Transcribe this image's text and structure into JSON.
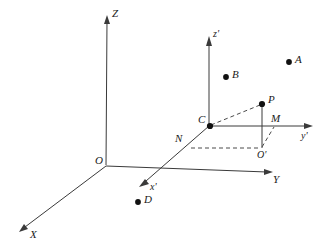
{
  "figure": {
    "background_color": "#ffffff",
    "line_color": "#3a3a3a",
    "point_color": "#111111",
    "width": 329,
    "height": 251
  },
  "axes": {
    "primary": [
      {
        "id": "z-axis",
        "label": "Z",
        "label_x": 112,
        "label_y": 8,
        "from": [
          106,
          165
        ],
        "to": [
          107,
          20
        ]
      },
      {
        "id": "y-axis",
        "label": "Y",
        "label_x": 273,
        "label_y": 174,
        "from": [
          106,
          166
        ],
        "to": [
          269,
          172
        ]
      },
      {
        "id": "x-axis",
        "label": "X",
        "label_x": 30,
        "label_y": 230,
        "from": [
          106,
          166
        ],
        "to": [
          23,
          228
        ]
      }
    ],
    "secondary": [
      {
        "id": "z-prime-axis",
        "label": "z'",
        "label_x": 213,
        "label_y": 29,
        "from": [
          209,
          126
        ],
        "to": [
          209,
          41
        ]
      },
      {
        "id": "y-prime-axis",
        "label": "y'",
        "label_x": 302,
        "label_y": 131,
        "from": [
          209,
          126
        ],
        "to": [
          309,
          126
        ]
      },
      {
        "id": "x-prime-axis",
        "label": "x'",
        "label_x": 150,
        "label_y": 183,
        "from": [
          209,
          126
        ],
        "to": [
          144,
          183
        ]
      }
    ]
  },
  "points": [
    {
      "id": "point-o",
      "label": "O",
      "dot": false,
      "x": 106,
      "y": 166,
      "label_x": 95,
      "label_y": 156
    },
    {
      "id": "point-c",
      "label": "C",
      "dot": true,
      "x": 210,
      "y": 126,
      "label_x": 198,
      "label_y": 114
    },
    {
      "id": "point-p",
      "label": "P",
      "dot": true,
      "x": 262,
      "y": 104,
      "label_x": 268,
      "label_y": 94
    },
    {
      "id": "point-a",
      "label": "A",
      "dot": true,
      "x": 289,
      "y": 62,
      "label_x": 295,
      "label_y": 54
    },
    {
      "id": "point-b",
      "label": "B",
      "dot": true,
      "x": 226,
      "y": 77,
      "label_x": 232,
      "label_y": 69
    },
    {
      "id": "point-d",
      "label": "D",
      "dot": true,
      "x": 138,
      "y": 202,
      "label_x": 144,
      "label_y": 194
    },
    {
      "id": "point-n",
      "label": "N",
      "dot": false,
      "x": 189,
      "y": 148,
      "label_x": 175,
      "label_y": 133
    },
    {
      "id": "point-m",
      "label": "M",
      "dot": false,
      "x": 272,
      "y": 126,
      "label_x": 271,
      "label_y": 114
    },
    {
      "id": "point-o-prime",
      "label": "O'",
      "dot": false,
      "x": 262,
      "y": 148,
      "label_x": 257,
      "label_y": 150
    }
  ],
  "segments": [
    {
      "id": "segment-c-p",
      "style": "dashed",
      "from": [
        211,
        126
      ],
      "to": [
        261,
        104
      ]
    },
    {
      "id": "segment-p-o-prime",
      "style": "solid",
      "from": [
        262,
        105
      ],
      "to": [
        262,
        148
      ]
    },
    {
      "id": "segment-c-m",
      "style": "solid",
      "from": [
        210,
        126
      ],
      "to": [
        272,
        126
      ]
    },
    {
      "id": "segment-n-o-prime",
      "style": "dashed",
      "from": [
        190,
        148
      ],
      "to": [
        261,
        148
      ]
    },
    {
      "id": "segment-o-prime-m",
      "style": "dashed",
      "from": [
        262,
        147
      ],
      "to": [
        273,
        127
      ]
    }
  ]
}
